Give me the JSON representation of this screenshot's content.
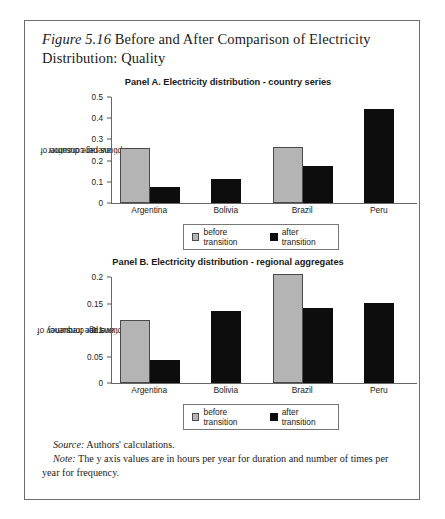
{
  "figure": {
    "number": "Figure 5.16",
    "title": " Before and After Comparison of Electricity Distribution: Quality"
  },
  "panels": [
    {
      "id": "panel-a",
      "title": "Panel A. Electricity distribution - country series",
      "ylabel_line1": "average duration of",
      "ylabel_line2": "interruptions per consumer"
    },
    {
      "id": "panel-b",
      "title": "Panel B. Electricity distribution - regional aggregates",
      "ylabel_line1": "average frequency of",
      "ylabel_line2": "interruptions per consumer"
    }
  ],
  "legend": {
    "before": "before transition",
    "after": "after transition"
  },
  "footer": {
    "source_label": "Source:",
    "source_text": " Authors' calculations.",
    "note_label": "Note:",
    "note_text": " The y axis values are in hours per year for duration and number of times per year for frequency."
  },
  "colors": {
    "before": "#b4b4b4",
    "after": "#0d0d0d",
    "axis": "#666666",
    "frame": "#6f6f6f"
  },
  "chart_data": [
    {
      "type": "bar",
      "title": "Panel A. Electricity distribution - country series",
      "xlabel": "",
      "ylabel": "average duration of interruptions per consumer",
      "ylim": [
        0,
        0.5
      ],
      "yticks": [
        0,
        0.1,
        0.2,
        0.3,
        0.4,
        0.5
      ],
      "ytick_labels": [
        "0",
        "0.1",
        "0.2",
        "0.3",
        "0.4",
        "0.5"
      ],
      "grid": false,
      "legend_position": "bottom-center",
      "categories": [
        "Argentina",
        "Bolivia",
        "Brazil",
        "Peru"
      ],
      "series": [
        {
          "name": "before transition",
          "values": [
            0.258,
            null,
            0.265,
            null
          ]
        },
        {
          "name": "after transition",
          "values": [
            0.075,
            0.115,
            0.175,
            0.445
          ]
        }
      ]
    },
    {
      "type": "bar",
      "title": "Panel B. Electricity distribution - regional aggregates",
      "xlabel": "",
      "ylabel": "average frequency of interruptions per consumer",
      "ylim": [
        0,
        0.2
      ],
      "yticks": [
        0,
        0.05,
        0.1,
        0.15,
        0.2
      ],
      "ytick_labels": [
        "0",
        "0.05",
        "0.1",
        "0.15",
        "0.2"
      ],
      "grid": false,
      "legend_position": "bottom-center",
      "categories": [
        "Argentina",
        "Bolivia",
        "Brazil",
        "Peru"
      ],
      "series": [
        {
          "name": "before transition",
          "values": [
            0.118,
            null,
            0.205,
            null
          ]
        },
        {
          "name": "after transition",
          "values": [
            0.044,
            0.135,
            0.141,
            0.151
          ]
        }
      ]
    }
  ]
}
